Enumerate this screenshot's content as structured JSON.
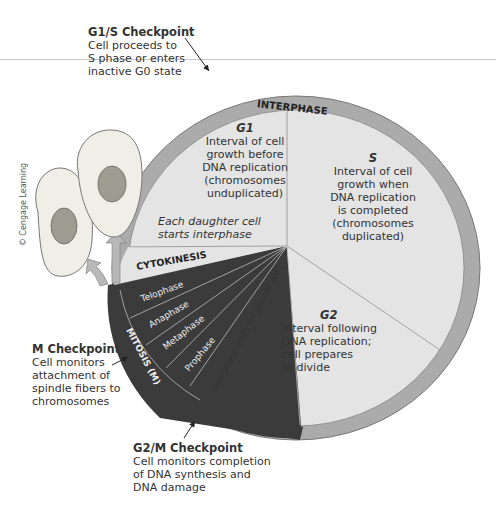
{
  "diagram": {
    "ring_label": "INTERPHASE",
    "phases": {
      "g1": {
        "name": "G1",
        "desc": [
          "Interval of cell",
          "growth before",
          "DNA replication",
          "(chromosomes",
          "unduplicated)"
        ]
      },
      "s": {
        "name": "S",
        "desc": [
          "Interval of cell",
          "growth when",
          "DNA replication",
          "is completed",
          "(chromosomes",
          "duplicated)"
        ]
      },
      "g2": {
        "name": "G2",
        "desc": [
          "Interval following",
          "DNA replication;",
          "cell prepares",
          "to divide"
        ]
      },
      "daughter": [
        "Each daughter cell",
        "starts interphase"
      ],
      "cytokinesis": "CYTOKINESIS",
      "mitosis": "MITOSIS (M)",
      "mitosis_stages": [
        "Telophase",
        "Anaphase",
        "Metaphase",
        "Prophase"
      ],
      "parent_end": "Interphase ends for parent cell"
    },
    "checkpoints": {
      "g1s": {
        "title": "G1/S Checkpoint",
        "lines": [
          "Cell proceeds to",
          "S phase or enters",
          "inactive G0 state"
        ]
      },
      "m": {
        "title": "M Checkpoint",
        "lines": [
          "Cell monitors",
          "attachment of",
          "spindle fibers to",
          "chromosomes"
        ]
      },
      "g2m": {
        "title": "G2/M Checkpoint",
        "lines": [
          "Cell monitors completion",
          "of DNA synthesis and",
          "DNA damage"
        ]
      }
    },
    "credit": "© Cengage Learning",
    "colors": {
      "ring": "#a9a9a9",
      "inner": "#e3e3e3",
      "mitosis": "#3a3a3a",
      "cell": "#f0f0ea",
      "nucleus": "#9a9a8c"
    }
  }
}
